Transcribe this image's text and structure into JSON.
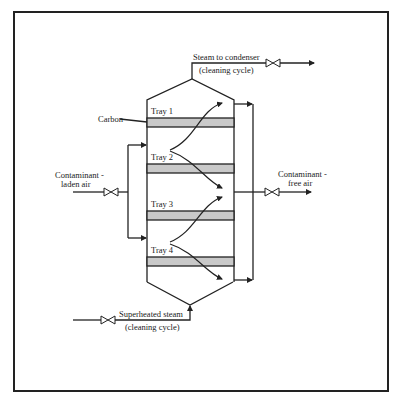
{
  "diagram": {
    "type": "process-flow",
    "labels": {
      "steam_out_line1": "Steam to condenser",
      "steam_out_line2": "(cleaning cycle)",
      "carbon": "Carbon",
      "inlet_line1": "Contaminant -",
      "inlet_line2": "laden air",
      "outlet_line1": "Contaminant -",
      "outlet_line2": "free air",
      "steam_in_line1": "Superheated steam",
      "steam_in_line2": "(cleaning cycle)"
    },
    "trays": [
      {
        "label": "Tray 1"
      },
      {
        "label": "Tray 2"
      },
      {
        "label": "Tray 3"
      },
      {
        "label": "Tray 4"
      }
    ],
    "colors": {
      "line": "#222222",
      "carbon_bed": "#c9c9c9",
      "background": "#ffffff"
    }
  }
}
